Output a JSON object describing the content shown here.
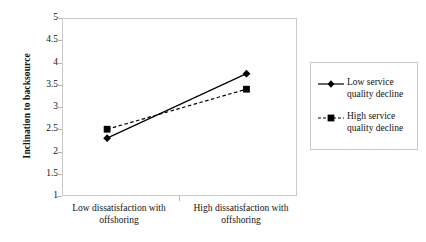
{
  "chart_data": {
    "type": "line",
    "title": "",
    "xlabel": "",
    "ylabel": "Inclination to backsource",
    "ylim": [
      1,
      5
    ],
    "ytick_labels": [
      "5",
      "4.5",
      "4",
      "3.5",
      "3",
      "2.5",
      "2",
      "1.5",
      "1"
    ],
    "ytick_values": [
      5,
      4.5,
      4,
      3.5,
      3,
      2.5,
      2,
      1.5,
      1
    ],
    "grid": false,
    "legend_position": "right",
    "categories": [
      "Low dissatisfaction with offshoring",
      "High dissatisfaction with offshoring"
    ],
    "series": [
      {
        "name": "Low service quality decline",
        "values": [
          2.3,
          3.75
        ],
        "line_style": "solid",
        "marker": "diamond",
        "color": "#000000"
      },
      {
        "name": "High service quality decline",
        "values": [
          2.5,
          3.4
        ],
        "line_style": "dashed",
        "marker": "square",
        "color": "#000000"
      }
    ]
  },
  "axes": {
    "y_title": "Inclination to backsource",
    "y_ticks": [
      "5",
      "4.5",
      "4",
      "3.5",
      "3",
      "2.5",
      "2",
      "1.5",
      "1"
    ],
    "x_categories": [
      "Low dissatisfaction with offshoring",
      "High dissatisfaction with offshoring"
    ]
  },
  "legend": {
    "entries": [
      {
        "label": "Low service quality decline"
      },
      {
        "label": "High service quality decline"
      }
    ]
  },
  "style": {
    "series_color": "#000000",
    "frame_color": "#c9c9c9",
    "background": "#ffffff"
  }
}
